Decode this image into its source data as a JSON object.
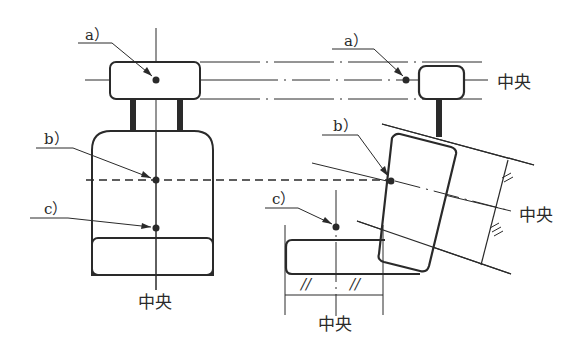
{
  "diagram": {
    "left_view": {
      "labels": {
        "a": "a）",
        "b": "b）",
        "c": "c）",
        "center": "中央"
      }
    },
    "right_view": {
      "labels": {
        "a": "a）",
        "b": "b）",
        "c": "c）",
        "center_top": "中央",
        "center_tilted": "中央",
        "center_bottom": "中央"
      },
      "equal_marks": [
        "//",
        "//"
      ]
    },
    "colors": {
      "line": "#2a2a2a",
      "background": "#ffffff"
    }
  }
}
